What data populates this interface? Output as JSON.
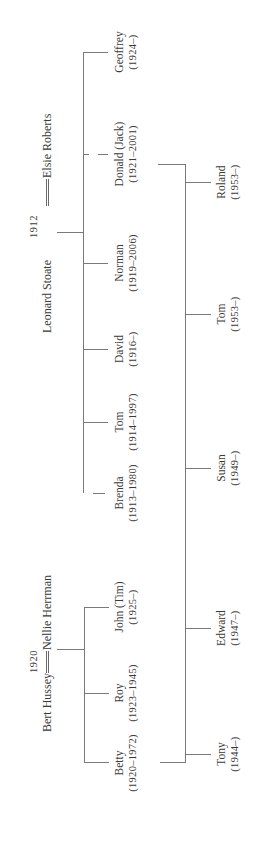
{
  "diagram": {
    "type": "family-tree",
    "orientation": "rotated-90-ccw",
    "line_color": "#7a7a7a",
    "text_color": "#3a3a3a"
  },
  "families": {
    "stoate": {
      "husband": "Leonard Stoate",
      "wife": "Elsie Roberts",
      "marriage_year": "1912",
      "children": [
        {
          "name": "Brenda",
          "dates": "(1913–1980)"
        },
        {
          "name": "Tom",
          "dates": "(1914–1997)"
        },
        {
          "name": "David",
          "dates": "(1916–)"
        },
        {
          "name": "Norman",
          "dates": "(1919–2006)"
        },
        {
          "name": "Donald (Jack)",
          "dates": "(1921–2001)"
        },
        {
          "name": "Geoffrey",
          "dates": "(1924–)"
        }
      ]
    },
    "hussey": {
      "husband": "Bert Hussey",
      "wife": "Nellie Herrman",
      "marriage_year": "1920",
      "children": [
        {
          "name": "Betty",
          "dates": "(1920–1972)"
        },
        {
          "name": "Roy",
          "dates": "(1923–1945)"
        },
        {
          "name": "John (Tim)",
          "dates": "(1925–)"
        }
      ]
    },
    "next_generation": {
      "parents": [
        "Betty",
        "Donald (Jack)"
      ],
      "children": [
        {
          "name": "Tony",
          "dates": "(1944–)"
        },
        {
          "name": "Edward",
          "dates": "(1947–)"
        },
        {
          "name": "Susan",
          "dates": "(1949–)"
        },
        {
          "name": "Tom",
          "dates": "(1953–)"
        },
        {
          "name": "Roland",
          "dates": "(1953–)"
        }
      ]
    }
  }
}
